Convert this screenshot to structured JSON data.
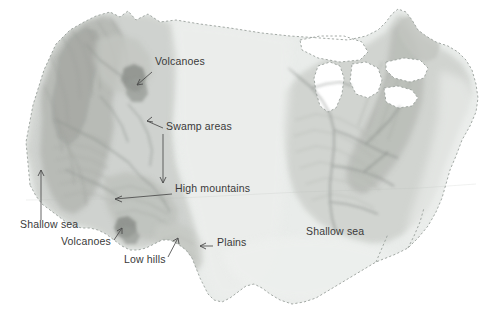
{
  "figure": {
    "kind": "paleogeographic-map",
    "region": "United States",
    "background_color": "#ffffff"
  },
  "palette": {
    "shallow_sea": "#e8ebe9",
    "lowland": "#dcdedb",
    "mid_relief": "#c9cbc7",
    "high_relief": "#b4b7b2",
    "highest_relief": "#a3a6a1",
    "river_line": "#8f9490",
    "coast_dash": "#9aa09c",
    "label_text": "#3a3a3a",
    "leader_line": "#4a4a4a"
  },
  "labels": [
    {
      "id": "volcanoes-north",
      "text": "Volcanoes",
      "x": 155,
      "y": 62,
      "leader": {
        "from_x": 152,
        "from_y": 72,
        "to_x": 137,
        "to_y": 85,
        "arrow": true
      }
    },
    {
      "id": "swamp-areas",
      "text": "Swamp areas",
      "x": 166,
      "y": 126,
      "leader": {
        "from_x": 163,
        "from_y": 128,
        "to_x": 147,
        "to_y": 121,
        "arrow": true
      },
      "leader2": {
        "from_x": 163,
        "from_y": 134,
        "to_x": 163,
        "to_y": 183,
        "arrow": true
      }
    },
    {
      "id": "high-mountains",
      "text": "High mountains",
      "x": 175,
      "y": 187,
      "leader": {
        "from_x": 172,
        "from_y": 194,
        "to_x": 115,
        "to_y": 199,
        "arrow": true
      }
    },
    {
      "id": "shallow-sea-west",
      "text": "Shallow sea",
      "x": 20,
      "y": 223,
      "leader": {
        "from_x": 41,
        "from_y": 220,
        "to_x": 41,
        "to_y": 170,
        "arrow": true
      }
    },
    {
      "id": "volcanoes-south",
      "text": "Volcanoes",
      "x": 61,
      "y": 240,
      "leader": {
        "from_x": 114,
        "from_y": 240,
        "to_x": 122,
        "to_y": 228,
        "arrow": true
      }
    },
    {
      "id": "low-hills",
      "text": "Low hills",
      "x": 124,
      "y": 258,
      "leader": {
        "from_x": 168,
        "from_y": 257,
        "to_x": 178,
        "to_y": 238,
        "arrow": true
      }
    },
    {
      "id": "plains",
      "text": "Plains",
      "x": 217,
      "y": 241,
      "leader": {
        "from_x": 213,
        "from_y": 246,
        "to_x": 200,
        "to_y": 246,
        "arrow": true
      }
    },
    {
      "id": "shallow-sea-east",
      "text": "Shallow sea",
      "x": 306,
      "y": 230,
      "leader": null
    }
  ]
}
